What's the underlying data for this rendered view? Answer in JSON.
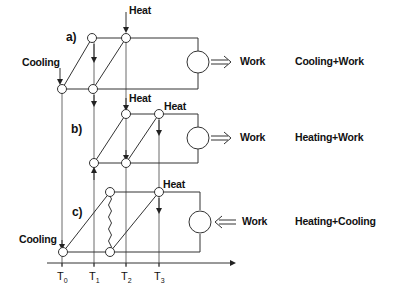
{
  "diagram": {
    "title": "",
    "panels": [
      {
        "id": "a",
        "label": "a)",
        "heat_labels": [
          "Heat"
        ],
        "cooling_label": "Cooling",
        "work_label": "Work",
        "work_direction": "out",
        "result": "Cooling+Work"
      },
      {
        "id": "b",
        "label": "b)",
        "heat_labels": [
          "Heat",
          "Heat"
        ],
        "work_label": "Work",
        "work_direction": "out",
        "result": "Heating+Work"
      },
      {
        "id": "c",
        "label": "c)",
        "heat_labels": [
          "Heat"
        ],
        "cooling_label": "Cooling",
        "work_label": "Work",
        "work_direction": "in",
        "result": "Heating+Cooling"
      }
    ],
    "axis": {
      "ticks": [
        {
          "main": "T",
          "sub": "0"
        },
        {
          "main": "T",
          "sub": "1"
        },
        {
          "main": "T",
          "sub": "2"
        },
        {
          "main": "T",
          "sub": "3"
        }
      ]
    }
  }
}
